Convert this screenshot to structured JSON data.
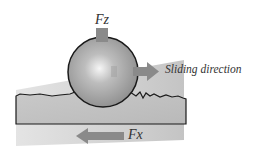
{
  "diagram": {
    "labels": {
      "normal_force": "Fz",
      "friction_force": "Fx",
      "sliding_direction": "Sliding direction"
    },
    "colors": {
      "sphere": "#9a9a9a",
      "sphere_highlight": "#f4f4f4",
      "arrow": "#8a8a8a",
      "surface": "#bdbdbd",
      "background_wedge": "#cfcfcf",
      "outline": "#1a1a1a",
      "text": "#333333"
    }
  }
}
